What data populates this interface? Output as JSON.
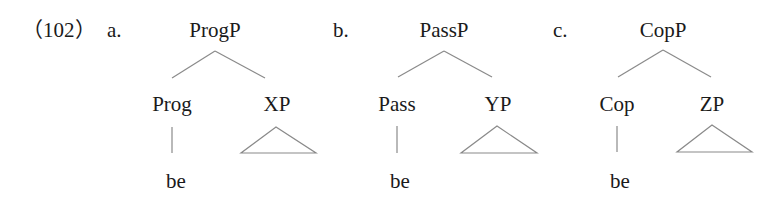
{
  "example_number": "（102）",
  "trees": [
    {
      "label": "a.",
      "root": "ProgP",
      "head": "Prog",
      "complement": "XP",
      "head_word": "be"
    },
    {
      "label": "b.",
      "root": "PassP",
      "head": "Pass",
      "complement": "YP",
      "head_word": "be"
    },
    {
      "label": "c.",
      "root": "CopP",
      "head": "Cop",
      "complement": "ZP",
      "head_word": "be"
    }
  ]
}
